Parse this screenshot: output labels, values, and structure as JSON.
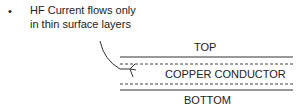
{
  "bullet": "•",
  "note_line1": "HF Current flows only",
  "note_line2": "in thin surface layers",
  "label_top": "TOP",
  "label_middle": "COPPER CONDUCTOR",
  "label_bottom": "BOTTOM",
  "colors": {
    "ink": "#222222",
    "background": "#ffffff"
  }
}
